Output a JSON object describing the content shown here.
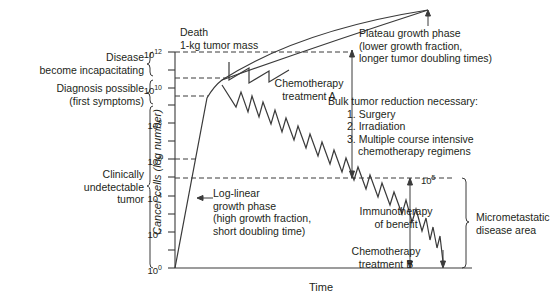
{
  "diagram": {
    "axes": {
      "y_label": "Cancer cells (log number)",
      "x_label": "Time",
      "y_ticks": [
        {
          "base": "10",
          "exp": "12"
        },
        {
          "base": "10",
          "exp": "10"
        },
        {
          "base": "10",
          "exp": "8"
        },
        {
          "base": "10",
          "exp": "6"
        },
        {
          "base": "10",
          "exp": "4"
        },
        {
          "base": "10",
          "exp": "2"
        },
        {
          "base": "10",
          "exp": "0"
        }
      ],
      "ref_105": {
        "base": "10",
        "exp": "5"
      }
    },
    "left_labels": {
      "disease_incap": [
        "Disease",
        "become incapacitating"
      ],
      "diagnosis": [
        "Diagnosis possible",
        "(first symptoms)"
      ],
      "undetectable": [
        "Clinically",
        "undetectable",
        "tumor"
      ]
    },
    "annotations": {
      "death": [
        "Death",
        "1-kg tumor mass"
      ],
      "plateau": [
        "Plateau growth phase",
        "(lower growth fraction,",
        "longer tumor doubling times)"
      ],
      "chemo_a": [
        "Chemotherapy",
        "treatment A"
      ],
      "bulk": {
        "title": "Bulk tumor reduction necessary:",
        "items": [
          "1. Surgery",
          "2. Irradiation",
          "3. Multiple course intensive",
          "chemotherapy regimens"
        ]
      },
      "loglinear": [
        "Log-linear",
        "growth phase",
        "(high growth fraction,",
        "short doubling time)"
      ],
      "immuno": [
        "Immunotherapy",
        "of benefit"
      ],
      "chemo_b": [
        "Chemotherapy",
        "treatment B"
      ],
      "micromet": [
        "Micrometastatic",
        "disease area"
      ]
    },
    "colors": {
      "line": "#3a3a3a",
      "text": "#231f20",
      "background": "#ffffff"
    }
  }
}
